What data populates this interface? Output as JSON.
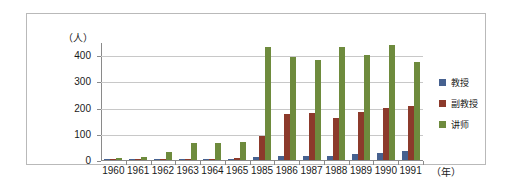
{
  "chart_data": {
    "type": "bar",
    "title": "",
    "subtitle": "",
    "xlabel": "（年）",
    "ylabel": "（人）",
    "ylim": [
      0,
      450
    ],
    "yticks": [
      0,
      100,
      200,
      300,
      400
    ],
    "ytick_labels": [
      "0",
      "100",
      "200",
      "300",
      "400"
    ],
    "grid": true,
    "legend_position": "right",
    "categories": [
      "1960",
      "1961",
      "1962",
      "1963",
      "1964",
      "1965",
      "1985",
      "1986",
      "1987",
      "1988",
      "1989",
      "1990",
      "1991"
    ],
    "series": [
      {
        "name": "教授",
        "color": "#46618f",
        "values": [
          2,
          2,
          3,
          4,
          4,
          5,
          10,
          14,
          14,
          16,
          22,
          25,
          35
        ]
      },
      {
        "name": "副教授",
        "color": "#8c3a2b",
        "values": [
          3,
          4,
          4,
          5,
          5,
          6,
          90,
          175,
          180,
          160,
          182,
          198,
          205
        ]
      },
      {
        "name": "讲师",
        "color": "#6e8b3d",
        "values": [
          8,
          12,
          32,
          66,
          66,
          68,
          432,
          392,
          382,
          430,
          400,
          440,
          375
        ]
      }
    ]
  },
  "legend": {
    "entries": [
      {
        "label": "教授"
      },
      {
        "label": "副教授"
      },
      {
        "label": "讲师"
      }
    ]
  },
  "axes": {
    "y_title": "（人）",
    "x_title": "（年）"
  }
}
